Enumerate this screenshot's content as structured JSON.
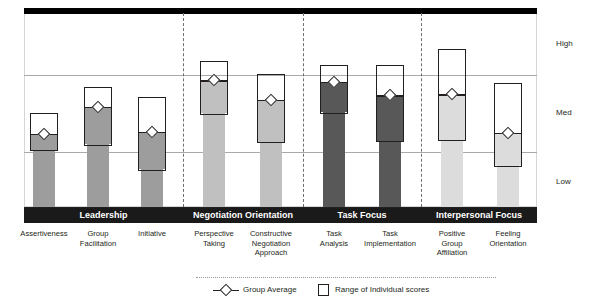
{
  "chart_data": {
    "type": "bar",
    "title": "",
    "xlabel": "",
    "ylabel": "",
    "grid": true,
    "legend_position": "bottom",
    "axis": {
      "tick_labels": [
        "High",
        "Med",
        "Low"
      ],
      "band_high": "High",
      "band_med": "Med",
      "band_low": "Low",
      "ylim": [
        0,
        3
      ]
    },
    "groups": [
      {
        "name": "Leadership",
        "color": "#9d9d9d",
        "categories": [
          "Assertiveness",
          "Group Facilitation",
          "Initiative"
        ]
      },
      {
        "name": "Negotiation Orientation",
        "color": "#c0c0c0",
        "categories": [
          "Perspective Taking",
          "Constructive Negotiation Approach"
        ]
      },
      {
        "name": "Task Focus",
        "color": "#585858",
        "categories": [
          "Task Analysis",
          "Task Implementation"
        ]
      },
      {
        "name": "Interpersonal Focus",
        "color": "#dcdcdc",
        "categories": [
          "Positive Group Affiliation",
          "Feeling Orientation"
        ]
      }
    ],
    "categories": [
      "Assertiveness",
      "Group Facilitation",
      "Initiative",
      "Perspective Taking",
      "Constructive Negotiation Approach",
      "Task Analysis",
      "Task Implementation",
      "Positive Group Affiliation",
      "Feeling Orientation"
    ],
    "series": [
      {
        "name": "Range of Individual scores",
        "description": "low-to-high box of individual scores per competency",
        "range_low": [
          0.86,
          0.95,
          0.56,
          1.43,
          0.99,
          1.44,
          1.0,
          1.02,
          0.62
        ],
        "range_high": [
          1.45,
          1.86,
          1.7,
          2.26,
          2.05,
          2.2,
          2.2,
          2.45,
          1.92
        ]
      },
      {
        "name": "Group Average",
        "description": "diamond marker at group mean",
        "values": [
          1.13,
          1.55,
          1.16,
          1.96,
          1.66,
          1.94,
          1.73,
          1.74,
          1.15
        ]
      }
    ],
    "labels": [
      [
        "Assertiveness"
      ],
      [
        "Group",
        "Facilitation"
      ],
      [
        "Initiative"
      ],
      [
        "Perspective",
        "Taking"
      ],
      [
        "Constructive",
        "Negotiation",
        "Approach"
      ],
      [
        "Task",
        "Analysis"
      ],
      [
        "Task",
        "Implementation"
      ],
      [
        "Positive",
        "Group",
        "Affiliation"
      ],
      [
        "Feeling",
        "Orientation"
      ]
    ]
  },
  "legend": {
    "average_label": "Group Average",
    "range_label": "Range of Individual scores"
  },
  "colors": {
    "leadership": "#9d9d9d",
    "negotiation": "#c0c0c0",
    "task": "#585858",
    "interpersonal": "#dcdcdc",
    "outline": "#231f20",
    "strip": "#1a1a1a",
    "gridline": "#a9a9a9"
  }
}
